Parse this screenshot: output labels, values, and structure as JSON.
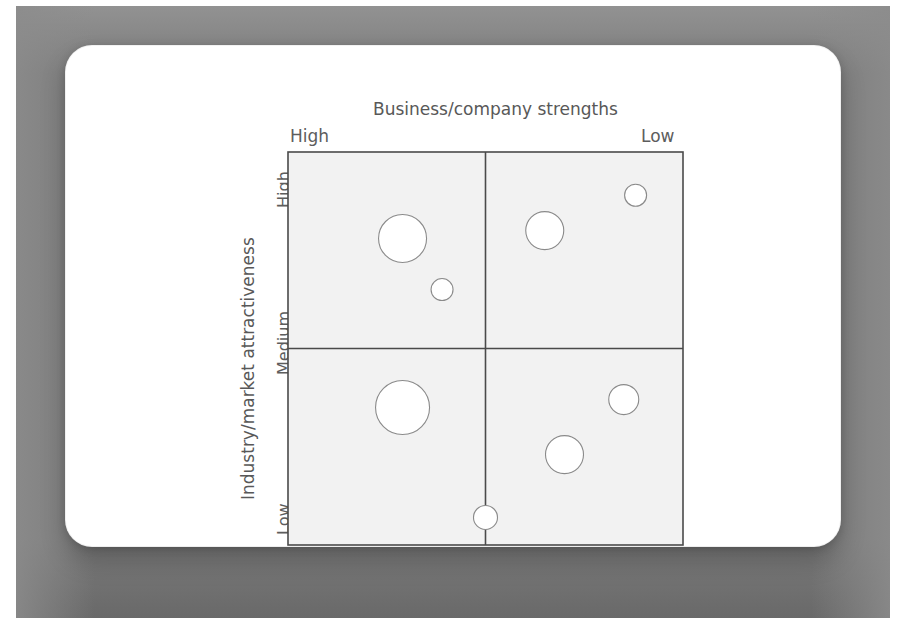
{
  "page": {
    "background": "#ffffff",
    "frame_color": "#7b7b7b",
    "card_color": "#ffffff"
  },
  "chart_data": {
    "type": "scatter",
    "title": "Business/company strengths",
    "xlabel": "Business/company strengths",
    "ylabel": "Industry/market attractiveness",
    "x_tick_labels": [
      "High",
      "Low"
    ],
    "y_tick_labels": [
      "High",
      "Medium",
      "Low"
    ],
    "x_axis_direction": "High to Low (left to right)",
    "y_axis_direction": "High to Low (top to bottom)",
    "grid": true,
    "legend": false,
    "plot_background": "#f2f2f2",
    "marker_style": "open circle outline",
    "marker_stroke": "#8a8a8a",
    "marker_fill": "#ffffff",
    "quadrant_divider_x": 0.5,
    "quadrant_divider_y": 0.5,
    "bubbles": [
      {
        "id": "b1",
        "quadrant": "top-left",
        "x": 0.29,
        "y": 0.78,
        "size": 24
      },
      {
        "id": "b2",
        "quadrant": "top-left",
        "x": 0.39,
        "y": 0.65,
        "size": 11
      },
      {
        "id": "b3",
        "quadrant": "top-right",
        "x": 0.65,
        "y": 0.8,
        "size": 19
      },
      {
        "id": "b4",
        "quadrant": "top-right",
        "x": 0.88,
        "y": 0.89,
        "size": 11
      },
      {
        "id": "b5",
        "quadrant": "bottom-left",
        "x": 0.29,
        "y": 0.35,
        "size": 27
      },
      {
        "id": "b6",
        "quadrant": "bottom-left",
        "x": 0.5,
        "y": 0.07,
        "size": 12
      },
      {
        "id": "b7",
        "quadrant": "bottom-right",
        "x": 0.7,
        "y": 0.23,
        "size": 19
      },
      {
        "id": "b8",
        "quadrant": "bottom-right",
        "x": 0.85,
        "y": 0.37,
        "size": 15
      }
    ]
  }
}
